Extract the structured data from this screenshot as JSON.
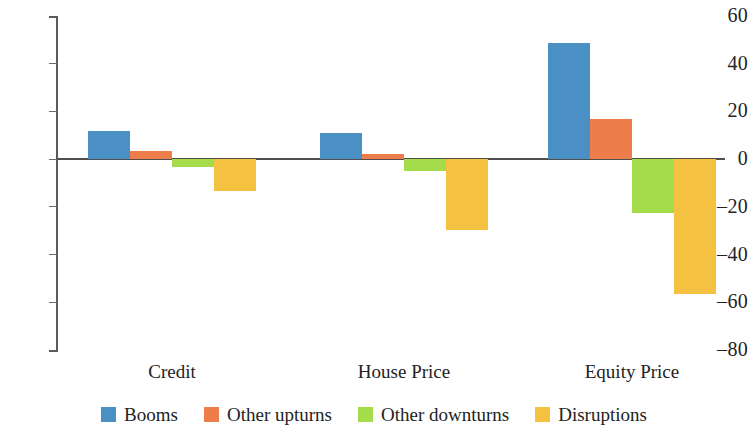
{
  "chart_data": {
    "type": "bar",
    "title": "",
    "subtitle": "",
    "xlabel": "",
    "ylabel": "",
    "categories": [
      "Credit",
      "House Price",
      "Equity Price"
    ],
    "series": [
      {
        "name": "Booms",
        "color": "#4a90c4",
        "values": [
          11.7,
          11.0,
          48.5
        ]
      },
      {
        "name": "Other upturns",
        "color": "#ed7d4a",
        "values": [
          3.3,
          2.1,
          17.0
        ]
      },
      {
        "name": "Other downturns",
        "color": "#a5dc4b",
        "values": [
          -3.4,
          -4.9,
          -22.5
        ]
      },
      {
        "name": "Disruptions",
        "color": "#f5c141",
        "values": [
          -13.5,
          -29.5,
          -56.5
        ]
      }
    ],
    "ylim": [
      -80,
      60
    ],
    "yticks": [
      60,
      40,
      20,
      0,
      -20,
      -40,
      -60,
      -80
    ],
    "ytick_labels": [
      "60",
      "40",
      "20",
      "0",
      "–20",
      "–40",
      "–60",
      "–80"
    ],
    "grid": false,
    "legend_position": "bottom",
    "zero_line": true
  },
  "legend": {
    "items": [
      {
        "label": "Booms"
      },
      {
        "label": "Other upturns"
      },
      {
        "label": "Other downturns"
      },
      {
        "label": "Disruptions"
      }
    ]
  }
}
